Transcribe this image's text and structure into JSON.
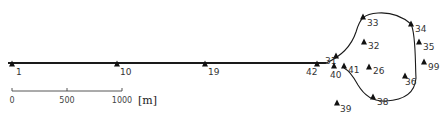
{
  "stations": [
    {
      "id": "1",
      "x": 12,
      "y": 64,
      "lx": 16,
      "ly": 75
    },
    {
      "id": "10",
      "x": 117,
      "y": 64,
      "lx": 120,
      "ly": 75
    },
    {
      "id": "19",
      "x": 205,
      "y": 64,
      "lx": 208,
      "ly": 75
    },
    {
      "id": "42",
      "x": 317,
      "y": 64,
      "lx": 306,
      "ly": 75
    },
    {
      "id": "31",
      "x": 336,
      "y": 56,
      "lx": 325,
      "ly": 64
    },
    {
      "id": "40",
      "x": 334,
      "y": 66,
      "lx": 330,
      "ly": 78
    },
    {
      "id": "41",
      "x": 344,
      "y": 66,
      "lx": 348,
      "ly": 73
    },
    {
      "id": "32",
      "x": 364,
      "y": 42,
      "lx": 368,
      "ly": 49
    },
    {
      "id": "26",
      "x": 369,
      "y": 67,
      "lx": 373,
      "ly": 74
    },
    {
      "id": "33",
      "x": 363,
      "y": 17,
      "lx": 367,
      "ly": 26
    },
    {
      "id": "34",
      "x": 411,
      "y": 24,
      "lx": 415,
      "ly": 32
    },
    {
      "id": "35",
      "x": 419,
      "y": 42,
      "lx": 423,
      "ly": 50
    },
    {
      "id": "99",
      "x": 424,
      "y": 62,
      "lx": 428,
      "ly": 70
    },
    {
      "id": "36",
      "x": 405,
      "y": 76,
      "lx": 405,
      "ly": 85
    },
    {
      "id": "38",
      "x": 373,
      "y": 97,
      "lx": 377,
      "ly": 105
    },
    {
      "id": "39",
      "x": 337,
      "y": 103,
      "lx": 340,
      "ly": 112
    }
  ],
  "scale_bar": {
    "ticks": [
      {
        "label": "0",
        "x": 12
      },
      {
        "label": "500",
        "x": 67
      },
      {
        "label": "1000",
        "x": 122
      }
    ],
    "unit": "[m]"
  },
  "colors": {
    "line": "#1a1a1a",
    "marker": "#111111",
    "text": "#333333"
  }
}
